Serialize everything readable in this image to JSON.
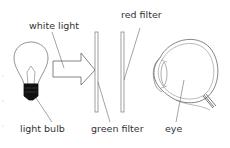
{
  "diagram": {
    "labels": {
      "white_light": "white light",
      "red_filter": "red filter",
      "light_bulb": "light bulb",
      "green_filter": "green filter",
      "eye": "eye"
    },
    "icons": [
      "light-bulb-icon",
      "arrow-right-icon",
      "filter-icon",
      "eye-icon"
    ],
    "colors": {
      "stroke": "#555555",
      "text": "#333333",
      "bulb_base": "#111111",
      "background": "#ffffff"
    }
  }
}
